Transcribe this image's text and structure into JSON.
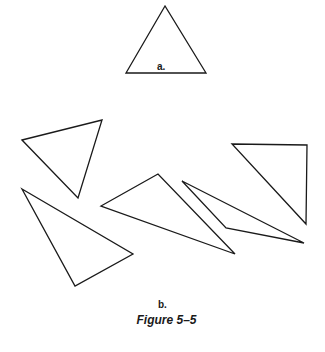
{
  "figure": {
    "caption": "Figure 5–5",
    "part_a": {
      "label": "a.",
      "triangle": [
        [
          165,
          6
        ],
        [
          126,
          73
        ],
        [
          206,
          73
        ]
      ]
    },
    "part_b": {
      "label": "b.",
      "triangles": [
        [
          [
            22,
            140
          ],
          [
            102,
            120
          ],
          [
            78,
            198
          ]
        ],
        [
          [
            22,
            189
          ],
          [
            133,
            254
          ],
          [
            75,
            286
          ]
        ],
        [
          [
            101,
            206
          ],
          [
            158,
            174
          ],
          [
            235,
            254
          ]
        ],
        [
          [
            182,
            181
          ],
          [
            226,
            228
          ],
          [
            304,
            243
          ]
        ],
        [
          [
            232,
            144
          ],
          [
            307,
            145
          ],
          [
            306,
            224
          ]
        ]
      ]
    },
    "stroke_color": "#1a1a1a",
    "background": "#ffffff"
  }
}
